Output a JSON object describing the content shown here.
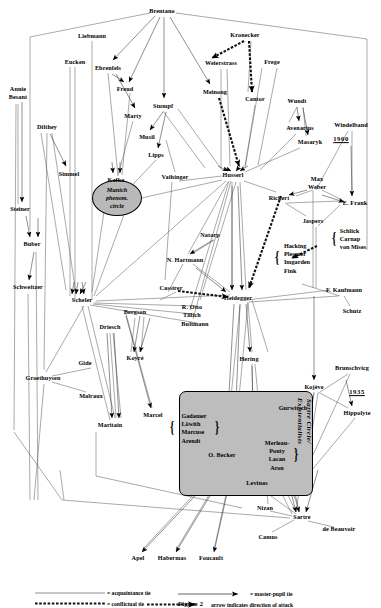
{
  "figure": {
    "caption": "Figure 2"
  },
  "legend": {
    "items": [
      {
        "key": "acquaintance",
        "label": "= acquaintance tie",
        "style": "thin-line"
      },
      {
        "key": "master-pupil",
        "label": "= master-pupil tie",
        "style": "arrow-line"
      },
      {
        "key": "conflictual",
        "label": "= conflictual tie",
        "style": "dashed-thick"
      },
      {
        "key": "attack-direction",
        "label": "arrow indicates direction of attack",
        "style": "dashed-thick-arrow"
      }
    ]
  },
  "year_markers": [
    {
      "id": "y1900",
      "label": "1900",
      "x": 341,
      "y": 139
    },
    {
      "id": "y1935",
      "label": "1935",
      "x": 357,
      "y": 392
    }
  ],
  "ellipses": [
    {
      "id": "munich",
      "label": "Munich\nphenom.\ncircle",
      "lines": [
        "Munich",
        "phenom.",
        "circle"
      ],
      "x": 117,
      "y": 198,
      "w": 48,
      "h": 34,
      "fill": "#b9b9b9"
    }
  ],
  "clusters": [
    {
      "id": "sartre-circle",
      "label": "Sartre Circle/\nExistentialists",
      "lines": [
        "Sartre Circle/",
        "Existentialists"
      ],
      "x": 245,
      "y": 442,
      "w": 132,
      "h": 103,
      "fill": "#bdbdbd"
    }
  ],
  "group_boxes": [
    {
      "id": "hacking-group",
      "members": [
        "Hacking",
        "Plessner",
        "Imgarden",
        "Fink"
      ],
      "x": 297,
      "y": 258,
      "brace": "left"
    },
    {
      "id": "schlick-group",
      "members": [
        "Schlick",
        "Carnap",
        "von Mises"
      ],
      "x": 353,
      "y": 239,
      "brace": "left"
    },
    {
      "id": "gadamer-group",
      "members": [
        "Gadamer",
        "Löwith",
        "Marcuse",
        "Arendt"
      ],
      "x": 194,
      "y": 428,
      "brace": "both"
    },
    {
      "id": "merleau-group",
      "members": [
        "Merleau-",
        "Ponty",
        "Lacan",
        "Aron"
      ],
      "x": 277,
      "y": 455,
      "brace": "right"
    }
  ],
  "nodes": [
    {
      "id": "brentano",
      "label": "Brentano",
      "x": 162,
      "y": 11
    },
    {
      "id": "liebmann",
      "label": "Liebmann",
      "x": 92,
      "y": 36
    },
    {
      "id": "kronecker",
      "label": "Kronecker",
      "x": 245,
      "y": 35
    },
    {
      "id": "eucken",
      "label": "Eucken",
      "x": 75,
      "y": 62
    },
    {
      "id": "ehrenfels",
      "label": "Ehrenfels",
      "x": 108,
      "y": 68
    },
    {
      "id": "weierstrass",
      "label": "Weierstrass",
      "x": 221,
      "y": 63
    },
    {
      "id": "frege",
      "label": "Frege",
      "x": 272,
      "y": 62
    },
    {
      "id": "freud",
      "label": "Freud",
      "x": 125,
      "y": 89
    },
    {
      "id": "meinong",
      "label": "Meinong",
      "x": 215,
      "y": 92
    },
    {
      "id": "cantor",
      "label": "Cantor",
      "x": 255,
      "y": 99
    },
    {
      "id": "wundt",
      "label": "Wundt",
      "x": 297,
      "y": 101
    },
    {
      "id": "annie-besant",
      "label": "Annie\nBesant",
      "lines": [
        "Annie",
        "Besant"
      ],
      "x": 18,
      "y": 93,
      "multi": true
    },
    {
      "id": "stumpf",
      "label": "Stumpf",
      "x": 163,
      "y": 106
    },
    {
      "id": "marty",
      "label": "Marty",
      "x": 133,
      "y": 116
    },
    {
      "id": "avenarius",
      "label": "Avenarius",
      "x": 300,
      "y": 128
    },
    {
      "id": "windelband",
      "label": "Windelband",
      "x": 351,
      "y": 125
    },
    {
      "id": "dilthey",
      "label": "Dilthey",
      "x": 47,
      "y": 127
    },
    {
      "id": "musil",
      "label": "Musil",
      "x": 147,
      "y": 137
    },
    {
      "id": "masaryk",
      "label": "Masaryk",
      "x": 310,
      "y": 142
    },
    {
      "id": "simmel",
      "label": "Simmel",
      "x": 69,
      "y": 174
    },
    {
      "id": "kafka",
      "label": "Kafka",
      "x": 116,
      "y": 180
    },
    {
      "id": "lipps",
      "label": "Lipps",
      "x": 156,
      "y": 155
    },
    {
      "id": "vaihinger",
      "label": "Vaihinger",
      "x": 175,
      "y": 177
    },
    {
      "id": "husserl",
      "label": "Husserl",
      "x": 233,
      "y": 175
    },
    {
      "id": "max-weber",
      "label": "Max\nWeber",
      "lines": [
        "Max",
        "Weber"
      ],
      "x": 317,
      "y": 183,
      "multi": true
    },
    {
      "id": "rickert",
      "label": "Rickert",
      "x": 279,
      "y": 198
    },
    {
      "id": "e-frank",
      "label": "E. Frank",
      "x": 355,
      "y": 203
    },
    {
      "id": "steiner",
      "label": "Steiner",
      "x": 20,
      "y": 209
    },
    {
      "id": "jaspers",
      "label": "Jaspers",
      "x": 313,
      "y": 221
    },
    {
      "id": "buber",
      "label": "Buber",
      "x": 32,
      "y": 244
    },
    {
      "id": "natorp",
      "label": "Natorp",
      "x": 210,
      "y": 235
    },
    {
      "id": "n-hartmann",
      "label": "N. Hartmann",
      "x": 185,
      "y": 260
    },
    {
      "id": "schweitzer",
      "label": "Schweitzer",
      "x": 28,
      "y": 287
    },
    {
      "id": "cassirer",
      "label": "Cassirer",
      "x": 171,
      "y": 288
    },
    {
      "id": "f-kaufmann",
      "label": "F. Kaufmann",
      "x": 344,
      "y": 290
    },
    {
      "id": "scheler",
      "label": "Scheler",
      "x": 82,
      "y": 300
    },
    {
      "id": "heidegger",
      "label": "Heidegger",
      "x": 238,
      "y": 298
    },
    {
      "id": "schutz",
      "label": "Schutz",
      "x": 352,
      "y": 311
    },
    {
      "id": "r-otto",
      "label": "R. Otto",
      "x": 192,
      "y": 307
    },
    {
      "id": "tillich",
      "label": "Tillich",
      "x": 192,
      "y": 315
    },
    {
      "id": "bultmann",
      "label": "Bultmann",
      "x": 195,
      "y": 324
    },
    {
      "id": "bergson",
      "label": "Bergson",
      "x": 135,
      "y": 312
    },
    {
      "id": "driesch",
      "label": "Driesch",
      "x": 110,
      "y": 327
    },
    {
      "id": "hering",
      "label": "Hering",
      "x": 249,
      "y": 359
    },
    {
      "id": "koyre",
      "label": "Koyré",
      "x": 135,
      "y": 358
    },
    {
      "id": "gide",
      "label": "Gide",
      "x": 85,
      "y": 363
    },
    {
      "id": "brunschvicg",
      "label": "Brunschvicg",
      "x": 352,
      "y": 368
    },
    {
      "id": "groethuysen",
      "label": "Groethuysen",
      "x": 43,
      "y": 378
    },
    {
      "id": "malraux",
      "label": "Malraux",
      "x": 91,
      "y": 396
    },
    {
      "id": "kojeve",
      "label": "Kojève",
      "x": 314,
      "y": 387
    },
    {
      "id": "gurwitsch",
      "label": "Gurwitsch",
      "x": 293,
      "y": 408
    },
    {
      "id": "hippolyte",
      "label": "Hippolyte",
      "x": 357,
      "y": 413
    },
    {
      "id": "maritain",
      "label": "Maritain",
      "x": 110,
      "y": 425
    },
    {
      "id": "marcel",
      "label": "Marcel",
      "x": 153,
      "y": 415
    },
    {
      "id": "o-becker",
      "label": "O. Becker",
      "x": 222,
      "y": 455
    },
    {
      "id": "levinas",
      "label": "Levinas",
      "x": 257,
      "y": 483
    },
    {
      "id": "nizan",
      "label": "Nizan",
      "x": 265,
      "y": 508
    },
    {
      "id": "sartre",
      "label": "Sartre",
      "x": 302,
      "y": 517
    },
    {
      "id": "de-beauvoir",
      "label": "de Beauvoir",
      "x": 339,
      "y": 529
    },
    {
      "id": "camus",
      "label": "Camus",
      "x": 268,
      "y": 537
    },
    {
      "id": "apel",
      "label": "Apel",
      "x": 138,
      "y": 558
    },
    {
      "id": "habermas",
      "label": "Habermas",
      "x": 172,
      "y": 558
    },
    {
      "id": "foucault",
      "label": "Foucault",
      "x": 211,
      "y": 558
    }
  ],
  "tie_types": {
    "acquaintance": "thin solid line, no arrowhead",
    "master_pupil": "solid line with filled arrowhead",
    "conflictual": "thick dashed line with arrowhead showing direction of attack"
  }
}
